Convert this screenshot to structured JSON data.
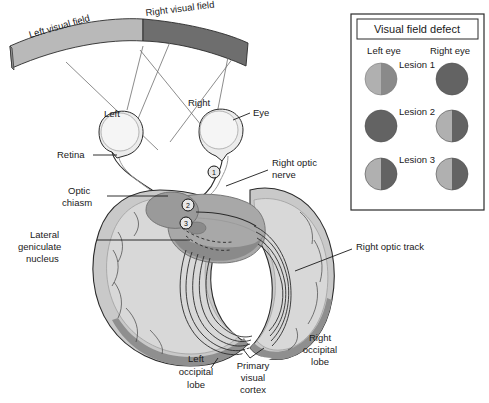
{
  "figure": {
    "type": "anatomical-diagram",
    "background_color": "#ffffff"
  },
  "visual_field_band": {
    "left": {
      "label": "Left visual field",
      "color": "#b9b9b9"
    },
    "right": {
      "label": "Right visual field",
      "color": "#6e6e6e"
    }
  },
  "eyes": {
    "left_label": "Left",
    "right_label": "Right",
    "eye_label": "Eye"
  },
  "labels": {
    "retina": "Retina",
    "optic_chiasm_line1": "Optic",
    "optic_chiasm_line2": "chiasm",
    "lgn_line1": "Lateral",
    "lgn_line2": "geniculate",
    "lgn_line3": "nucleus",
    "right_optic_nerve_line1": "Right optic",
    "right_optic_nerve_line2": "nerve",
    "right_optic_track": "Right optic track",
    "left_occipital_line1": "Left",
    "left_occipital_line2": "occipital",
    "left_occipital_line3": "lobe",
    "primary_visual_cortex_line1": "Primary",
    "primary_visual_cortex_line2": "visual",
    "primary_visual_cortex_line3": "cortex",
    "right_occipital_line1": "Right",
    "right_occipital_line2": "occipital",
    "right_occipital_line3": "lobe"
  },
  "lesion_markers": [
    {
      "id": "1",
      "x": 214,
      "y": 172
    },
    {
      "id": "2",
      "x": 188,
      "y": 205
    },
    {
      "id": "3",
      "x": 186,
      "y": 223
    }
  ],
  "legend": {
    "title": "Visual field defect",
    "col_left": "Left eye",
    "col_right": "Right eye",
    "border_color": "#2b2b2b",
    "rows": [
      {
        "lesion_label": "Lesion 1",
        "left_eye": {
          "left_half": "#b0b0b0",
          "right_half": "#8a8a8a"
        },
        "right_eye": {
          "left_half": "#636363",
          "right_half": "#636363"
        }
      },
      {
        "lesion_label": "Lesion 2",
        "left_eye": {
          "left_half": "#636363",
          "right_half": "#636363"
        },
        "right_eye": {
          "left_half": "#b0b0b0",
          "right_half": "#636363"
        }
      },
      {
        "lesion_label": "Lesion 3",
        "left_eye": {
          "left_half": "#b0b0b0",
          "right_half": "#636363"
        },
        "right_eye": {
          "left_half": "#b0b0b0",
          "right_half": "#636363"
        }
      }
    ]
  },
  "colors": {
    "brain_light": "#d0d0d0",
    "brain_mid": "#b3b3b3",
    "brain_dark": "#8f8f8f",
    "brain_darker": "#767676",
    "outline": "#2b2b2b",
    "text": "#1a1a1a"
  }
}
